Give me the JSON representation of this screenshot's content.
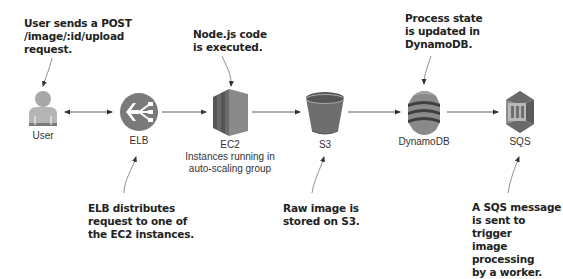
{
  "diagram": {
    "nodes": [
      {
        "id": "user",
        "label": "User",
        "icon": "user-icon"
      },
      {
        "id": "elb",
        "label": "ELB",
        "icon": "load-balancer-icon"
      },
      {
        "id": "ec2",
        "label": "EC2",
        "sublabel_line1": "Instances running in",
        "sublabel_line2": "auto-scaling group",
        "icon": "ec2-instances-icon"
      },
      {
        "id": "s3",
        "label": "S3",
        "icon": "s3-bucket-icon"
      },
      {
        "id": "dynamodb",
        "label": "DynamoDB",
        "icon": "dynamodb-icon"
      },
      {
        "id": "sqs",
        "label": "SQS",
        "icon": "sqs-queue-icon"
      }
    ],
    "edges": [
      {
        "from": "user",
        "to": "elb",
        "bidirectional": true
      },
      {
        "from": "elb",
        "to": "ec2",
        "bidirectional": false
      },
      {
        "from": "ec2",
        "to": "s3",
        "bidirectional": false
      },
      {
        "from": "s3",
        "to": "dynamodb",
        "bidirectional": false
      },
      {
        "from": "dynamodb",
        "to": "sqs",
        "bidirectional": false
      }
    ],
    "annotations": {
      "user": "User sends a POST\n/image/:id/upload\nrequest.",
      "ec2": "Node.js code\nis executed.",
      "dynamodb": "Process state\nis updated in\nDynamoDB.",
      "elb": "ELB distributes\nrequest to one of\nthe EC2 instances.",
      "s3": "Raw image is\nstored on S3.",
      "sqs": "A SQS message\nis sent to trigger\nimage processing\nby a worker."
    },
    "colors": {
      "icon_dark": "#6b6b6b",
      "icon_mid": "#8a8a8a",
      "icon_light": "#b0b0b0",
      "arrow": "#333333",
      "text": "#222222"
    }
  }
}
